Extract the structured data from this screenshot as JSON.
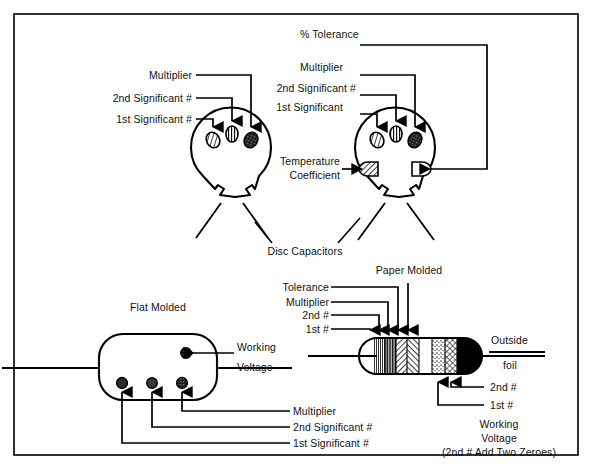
{
  "figure": {
    "background_color": "#ffffff",
    "ink_color": "#000000",
    "frame": {
      "x": 14,
      "y": 14,
      "width": 564,
      "height": 441,
      "border_color": "#000000"
    }
  },
  "sections": {
    "disc": {
      "caption": "Disc Capacitors",
      "left_capacitor": {
        "name": "three-band-disc-capacitor",
        "labels": [
          {
            "key": "multiplier",
            "text": "Multiplier"
          },
          {
            "key": "second_significant",
            "text": "2nd Significant #"
          },
          {
            "key": "first_significant",
            "text": "1st Significant #"
          }
        ],
        "bands": [
          {
            "position": "top-left",
            "pattern": "diagonal-hatch",
            "meaning": "1st Significant #"
          },
          {
            "position": "top-center",
            "pattern": "vertical-lines",
            "meaning": "2nd Significant #"
          },
          {
            "position": "top-right",
            "pattern": "dense-dark",
            "meaning": "Multiplier"
          }
        ]
      },
      "right_capacitor": {
        "name": "five-band-disc-capacitor",
        "labels": [
          {
            "key": "percent_tolerance",
            "text": "% Tolerance"
          },
          {
            "key": "multiplier",
            "text": "Multiplier"
          },
          {
            "key": "second_significant",
            "text": "2nd Significant #"
          },
          {
            "key": "first_significant",
            "text": "1st Significant"
          },
          {
            "key": "temperature_coefficient_line1",
            "text": "Temperature"
          },
          {
            "key": "temperature_coefficient_line2",
            "text": "Coefficient"
          }
        ],
        "bands": [
          {
            "position": "top-left",
            "pattern": "diagonal-hatch",
            "meaning": "1st Significant"
          },
          {
            "position": "top-center",
            "pattern": "vertical-lines",
            "meaning": "2nd Significant #"
          },
          {
            "position": "top-right",
            "pattern": "dense-dark",
            "meaning": "Multiplier"
          },
          {
            "position": "left-side",
            "pattern": "diagonal-hatch",
            "meaning": "Temperature Coefficient"
          },
          {
            "position": "right-side",
            "pattern": "blank",
            "meaning": "% Tolerance"
          }
        ]
      }
    },
    "flat_molded": {
      "caption": "Flat Molded",
      "labels": [
        {
          "key": "working_voltage_line1",
          "text": "Working"
        },
        {
          "key": "working_voltage_line2",
          "text": "Voltage"
        },
        {
          "key": "multiplier",
          "text": "Multiplier"
        },
        {
          "key": "second_significant",
          "text": "2nd Significant #"
        },
        {
          "key": "first_significant",
          "text": "1st Significant #"
        }
      ],
      "dots": [
        {
          "position": "bottom-left",
          "meaning": "1st Significant #"
        },
        {
          "position": "bottom-center",
          "meaning": "2nd Significant #"
        },
        {
          "position": "bottom-right",
          "meaning": "Multiplier"
        },
        {
          "position": "upper-right",
          "meaning": "Working Voltage"
        }
      ]
    },
    "paper_molded": {
      "caption": "Paper Molded",
      "labels": [
        {
          "key": "tolerance",
          "text": "Tolerance"
        },
        {
          "key": "multiplier",
          "text": "Multiplier"
        },
        {
          "key": "second_number",
          "text": "2nd #"
        },
        {
          "key": "first_number",
          "text": "1st #"
        },
        {
          "key": "outside",
          "text": "Outside"
        },
        {
          "key": "foil",
          "text": "foil"
        },
        {
          "key": "second_number_lower",
          "text": "2nd #"
        },
        {
          "key": "first_number_lower",
          "text": "1st #"
        },
        {
          "key": "working_line1",
          "text": "Working"
        },
        {
          "key": "working_line2",
          "text": "Voltage"
        },
        {
          "key": "working_line3",
          "text": "(2nd # Add Two Zeroes)"
        }
      ],
      "bands": [
        {
          "index": 1,
          "pattern": "fine-vertical",
          "meaning": "1st #"
        },
        {
          "index": 2,
          "pattern": "dense-vertical",
          "meaning": "2nd #"
        },
        {
          "index": 3,
          "pattern": "diagonal-hatch-right",
          "meaning": "Multiplier"
        },
        {
          "index": 4,
          "pattern": "diagonal-hatch-left",
          "meaning": "Tolerance"
        },
        {
          "index": 5,
          "pattern": "blank",
          "meaning": "body"
        },
        {
          "index": 6,
          "pattern": "stipple",
          "meaning": "1st # working voltage"
        },
        {
          "index": 7,
          "pattern": "cross-hatch",
          "meaning": "2nd # working voltage"
        },
        {
          "index": 8,
          "pattern": "solid-black",
          "meaning": "Outside foil"
        }
      ]
    }
  }
}
